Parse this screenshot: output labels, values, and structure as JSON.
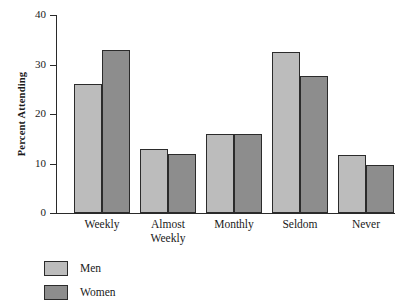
{
  "chart_data": {
    "type": "bar",
    "title": "",
    "xlabel": "",
    "ylabel": "Percent Attending",
    "ylim": [
      0,
      40
    ],
    "yticks": [
      0,
      10,
      20,
      30,
      40
    ],
    "grid": false,
    "legend_position": "bottom-left",
    "categories": [
      "Weekly",
      "Almost Weekly",
      "Monthly",
      "Seldom",
      "Never"
    ],
    "category_lines": [
      [
        "Weekly"
      ],
      [
        "Almost",
        "Weekly"
      ],
      [
        "Monthly"
      ],
      [
        "Seldom"
      ],
      [
        "Never"
      ]
    ],
    "series": [
      {
        "name": "Men",
        "color": "#bcbcbc",
        "values": [
          26.0,
          13.0,
          16.0,
          32.6,
          11.8
        ]
      },
      {
        "name": "Women",
        "color": "#8d8d8d",
        "values": [
          33.0,
          12.0,
          16.0,
          27.6,
          9.8
        ]
      }
    ]
  },
  "axis": {
    "y_tick_labels": [
      "0",
      "10",
      "20",
      "30",
      "40"
    ],
    "y_axis_title": "Percent Attending"
  },
  "legend": {
    "items": [
      {
        "label": "Men",
        "swatch": "men-swatch"
      },
      {
        "label": "Women",
        "swatch": "women-swatch"
      }
    ]
  }
}
